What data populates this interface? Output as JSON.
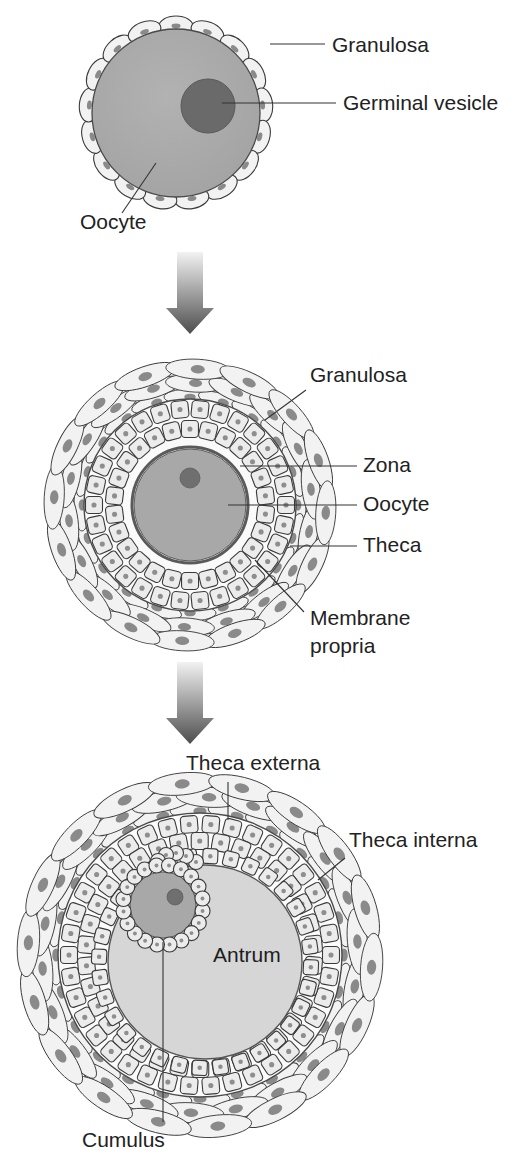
{
  "figure": {
    "background_color": "#ffffff"
  },
  "palette": {
    "outline": "#3a3a3a",
    "oocyte_fill": "#a8a8a8",
    "germinal_vesicle_fill": "#6a6a6a",
    "granulosa_cell_fill": "#ececec",
    "granulosa_nucleus_fill": "#8e8e8e",
    "theca_fill": "#f2f2f2",
    "theca_nucleus_fill": "#8a8a8a",
    "antrum_fill": "#d6d6d6",
    "zona_stroke": "#5a5a5a",
    "leader_line": "#333333",
    "text": "#222222",
    "arrow_gradient_top": "#f0f0f0",
    "arrow_gradient_bottom": "#4d4d4d"
  },
  "stages": [
    {
      "id": "primordial-follicle",
      "name": "Primordial / primary follicle",
      "order": 1,
      "center": {
        "x": 176,
        "y": 113
      },
      "labels": [
        {
          "id": "granulosa",
          "text": "Granulosa",
          "text_x": 332,
          "text_y": 52,
          "leader": "M 270 44 L 325 44"
        },
        {
          "id": "germinal-vesicle",
          "text": "Germinal vesicle",
          "text_x": 343,
          "text_y": 110,
          "leader": "M 222 103 L 336 103"
        },
        {
          "id": "oocyte",
          "text": "Oocyte",
          "text_x": 80,
          "text_y": 229,
          "leader": "M 156 163 L 122 213"
        }
      ]
    },
    {
      "id": "preantral-follicle",
      "name": "Preantral / secondary follicle",
      "order": 2,
      "center": {
        "x": 190,
        "y": 505
      },
      "labels": [
        {
          "id": "granulosa",
          "text": "Granulosa",
          "text_x": 310,
          "text_y": 382,
          "leader": "M 265 420 L 306 390"
        },
        {
          "id": "zona",
          "text": "Zona",
          "text_x": 363,
          "text_y": 472,
          "leader": "M 240 466 L 357 466"
        },
        {
          "id": "oocyte",
          "text": "Oocyte",
          "text_x": 363,
          "text_y": 511,
          "leader": "M 228 505 L 357 505"
        },
        {
          "id": "theca",
          "text": "Theca",
          "text_x": 363,
          "text_y": 552,
          "leader": "M 290 546 L 357 546"
        },
        {
          "id": "membrane-propria",
          "text": "Membrane",
          "text_x": 310,
          "text_y": 625,
          "leader": "M 255 560 L 304 612",
          "second_line": {
            "text": "propria",
            "text_x": 310,
            "text_y": 653
          }
        }
      ]
    },
    {
      "id": "antral-follicle",
      "name": "Antral / Graafian follicle",
      "order": 3,
      "center": {
        "x": 200,
        "y": 955
      },
      "labels": [
        {
          "id": "theca-externa",
          "text": "Theca externa",
          "text_x": 186,
          "text_y": 770,
          "leader": "M 228 782 L 228 820"
        },
        {
          "id": "theca-interna",
          "text": "Theca interna",
          "text_x": 349,
          "text_y": 847,
          "leader": "M 318 880 L 345 858"
        },
        {
          "id": "antrum",
          "text": "Antrum",
          "text_x": 213,
          "text_y": 962,
          "leader": ""
        },
        {
          "id": "cumulus",
          "text": "Cumulus",
          "text_x": 82,
          "text_y": 1147,
          "leader": "M 163 912 L 163 1122"
        }
      ]
    }
  ],
  "arrows": [
    {
      "id": "arrow-stage1-to-stage2",
      "x": 190,
      "y": 252,
      "width": 46,
      "height": 82
    },
    {
      "id": "arrow-stage2-to-stage3",
      "x": 190,
      "y": 662,
      "width": 46,
      "height": 82
    }
  ]
}
